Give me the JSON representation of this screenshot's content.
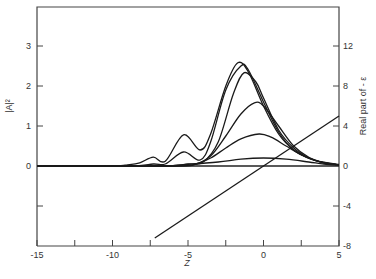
{
  "chart_data": {
    "type": "line",
    "title": "",
    "xlabel": "Z",
    "ylabel_left": "|A|²",
    "ylabel_right": "Real part of - ε",
    "xlim": [
      -15,
      5
    ],
    "ylim_left": [
      -2,
      4
    ],
    "ylim_right": [
      -8,
      16
    ],
    "grid": false,
    "legend": null,
    "x_ticks": [
      -15,
      -12.5,
      -10,
      -7.5,
      -5,
      -2.5,
      0,
      2.5,
      5
    ],
    "x_tick_labels": [
      "-15",
      "",
      "-10",
      "",
      "-5",
      "",
      "0",
      "",
      "5"
    ],
    "y_left_ticks": [
      -1,
      0,
      1,
      2,
      3
    ],
    "y_left_tick_labels": [
      "",
      "0",
      "1",
      "2",
      "3"
    ],
    "y_right_ticks": [
      -8,
      -4,
      0,
      4,
      8,
      12
    ],
    "y_right_tick_labels": [
      "-8",
      "-4",
      "0",
      "4",
      "8",
      "12"
    ],
    "series": [
      {
        "name": "curve 1",
        "axis": "left",
        "x": [
          -15,
          -10,
          -9,
          -8.2,
          -7.3,
          -6.5,
          -5.3,
          -4.2,
          -3.5,
          -2.5,
          -1.7,
          -1,
          0,
          1,
          2,
          3,
          4,
          5
        ],
        "y": [
          0,
          0,
          0.03,
          0.08,
          0.22,
          0.12,
          0.78,
          0.4,
          0.8,
          2.0,
          2.58,
          2.35,
          1.5,
          0.8,
          0.4,
          0.2,
          0.08,
          0.03
        ]
      },
      {
        "name": "curve 2",
        "axis": "left",
        "x": [
          -15,
          -9,
          -7.3,
          -6.5,
          -5.3,
          -4.2,
          -3.5,
          -2.5,
          -1.5,
          -1,
          0,
          1,
          2,
          3,
          4,
          5
        ],
        "y": [
          0,
          0,
          0.05,
          0.05,
          0.35,
          0.15,
          0.6,
          1.9,
          2.5,
          2.4,
          1.6,
          0.85,
          0.4,
          0.2,
          0.08,
          0.03
        ]
      },
      {
        "name": "curve 3",
        "axis": "left",
        "x": [
          -15,
          -7,
          -5,
          -4,
          -3,
          -2,
          -1.3,
          -0.5,
          0,
          1,
          2,
          3,
          4,
          5
        ],
        "y": [
          0,
          0,
          0.05,
          0.1,
          0.6,
          1.8,
          2.33,
          2.1,
          1.7,
          0.9,
          0.45,
          0.2,
          0.08,
          0.03
        ]
      },
      {
        "name": "curve 4",
        "axis": "left",
        "x": [
          -15,
          -6,
          -4.5,
          -3.5,
          -2.5,
          -1.5,
          -0.6,
          0,
          1,
          2,
          3,
          4,
          5
        ],
        "y": [
          0,
          0,
          0.05,
          0.25,
          0.75,
          1.3,
          1.58,
          1.5,
          1.0,
          0.5,
          0.22,
          0.09,
          0.03
        ]
      },
      {
        "name": "curve 5",
        "axis": "left",
        "x": [
          -15,
          -6,
          -4.5,
          -3.5,
          -2.5,
          -1.5,
          -0.3,
          0.5,
          1.5,
          2.5,
          3.5,
          5
        ],
        "y": [
          0,
          0,
          0.05,
          0.2,
          0.45,
          0.68,
          0.8,
          0.72,
          0.5,
          0.28,
          0.13,
          0.04
        ]
      },
      {
        "name": "curve 6",
        "axis": "left",
        "x": [
          -15,
          -7,
          -5,
          -3,
          -1.5,
          0,
          1.5,
          3,
          4,
          5
        ],
        "y": [
          0,
          0,
          0.04,
          0.1,
          0.17,
          0.2,
          0.17,
          0.1,
          0.05,
          0.02
        ]
      },
      {
        "name": "Real part of -ε",
        "axis": "right",
        "x": [
          -7.2,
          5
        ],
        "y": [
          -7.2,
          5
        ]
      }
    ]
  }
}
